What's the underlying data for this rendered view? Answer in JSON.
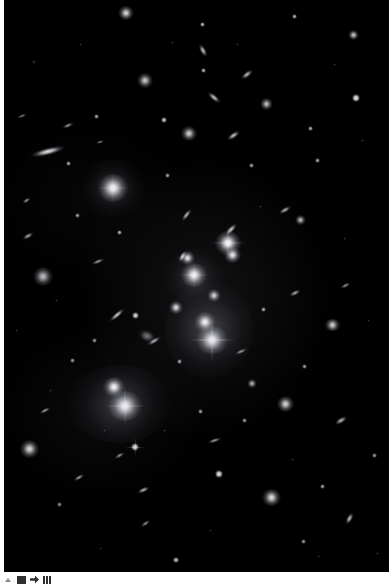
{
  "page": {
    "background_color": "#ffffff",
    "width": 392,
    "height": 587
  },
  "image_plate": {
    "name": "deep-field-astronomy-image",
    "alt_text": "Deep field astronomical image of a galaxy cluster",
    "background_color": "#000000",
    "left": 4,
    "top": 0,
    "width": 385,
    "height": 572,
    "objects": [
      {
        "kind": "gal",
        "x": 109,
        "y": 188,
        "w": 30,
        "h": 28,
        "b": 1.0
      },
      {
        "kind": "halo",
        "x": 109,
        "y": 188,
        "w": 62,
        "h": 58,
        "b": 0.55
      },
      {
        "kind": "gal",
        "x": 121,
        "y": 406,
        "w": 34,
        "h": 30,
        "b": 1.0
      },
      {
        "kind": "halo",
        "x": 116,
        "y": 404,
        "w": 104,
        "h": 78,
        "b": 0.7
      },
      {
        "kind": "gal",
        "x": 110,
        "y": 387,
        "w": 22,
        "h": 20,
        "b": 0.95
      },
      {
        "kind": "gal",
        "x": 208,
        "y": 340,
        "w": 32,
        "h": 28,
        "b": 1.0
      },
      {
        "kind": "halo",
        "x": 205,
        "y": 330,
        "w": 88,
        "h": 96,
        "b": 0.75
      },
      {
        "kind": "gal",
        "x": 201,
        "y": 322,
        "w": 22,
        "h": 20,
        "b": 0.92
      },
      {
        "kind": "gal",
        "x": 190,
        "y": 275,
        "w": 26,
        "h": 24,
        "b": 1.0
      },
      {
        "kind": "halo",
        "x": 190,
        "y": 277,
        "w": 58,
        "h": 54,
        "b": 0.5
      },
      {
        "kind": "gal",
        "x": 224,
        "y": 243,
        "w": 26,
        "h": 24,
        "b": 1.0
      },
      {
        "kind": "gal",
        "x": 228,
        "y": 255,
        "w": 17,
        "h": 16,
        "b": 0.9
      },
      {
        "kind": "gal",
        "x": 183,
        "y": 258,
        "w": 15,
        "h": 14,
        "b": 0.88
      },
      {
        "kind": "gal",
        "x": 172,
        "y": 307,
        "w": 14,
        "h": 13,
        "b": 0.85
      },
      {
        "kind": "gal",
        "x": 210,
        "y": 295,
        "w": 14,
        "h": 13,
        "b": 0.8
      },
      {
        "kind": "gal",
        "x": 39,
        "y": 276,
        "w": 20,
        "h": 19,
        "b": 0.72
      },
      {
        "kind": "gal",
        "x": 281,
        "y": 404,
        "w": 17,
        "h": 16,
        "b": 0.82
      },
      {
        "kind": "gal",
        "x": 267,
        "y": 497,
        "w": 19,
        "h": 17,
        "b": 0.86
      },
      {
        "kind": "gal",
        "x": 25,
        "y": 449,
        "w": 19,
        "h": 18,
        "b": 0.84
      },
      {
        "kind": "gal",
        "x": 185,
        "y": 133,
        "w": 16,
        "h": 15,
        "b": 0.8
      },
      {
        "kind": "gal",
        "x": 141,
        "y": 80,
        "w": 16,
        "h": 15,
        "b": 0.78
      },
      {
        "kind": "gal",
        "x": 122,
        "y": 13,
        "w": 16,
        "h": 14,
        "b": 0.84
      },
      {
        "kind": "gal",
        "x": 262,
        "y": 104,
        "w": 13,
        "h": 12,
        "b": 0.76
      },
      {
        "kind": "gal",
        "x": 349,
        "y": 35,
        "w": 11,
        "h": 10,
        "b": 0.78
      },
      {
        "kind": "gal",
        "x": 296,
        "y": 220,
        "w": 11,
        "h": 10,
        "b": 0.74
      },
      {
        "kind": "gal",
        "x": 328,
        "y": 325,
        "w": 17,
        "h": 12,
        "b": 0.8
      },
      {
        "kind": "gal",
        "x": 248,
        "y": 383,
        "w": 10,
        "h": 9,
        "b": 0.7
      },
      {
        "kind": "streak",
        "x": 44,
        "y": 151,
        "w": 40,
        "h": 9,
        "r": -14,
        "b": 0.92
      },
      {
        "kind": "streak",
        "x": 210,
        "y": 97,
        "w": 18,
        "h": 7,
        "r": 40,
        "b": 0.78
      },
      {
        "kind": "streak",
        "x": 199,
        "y": 50,
        "w": 16,
        "h": 7,
        "r": 62,
        "b": 0.76
      },
      {
        "kind": "streak",
        "x": 243,
        "y": 74,
        "w": 16,
        "h": 7,
        "r": -38,
        "b": 0.74
      },
      {
        "kind": "streak",
        "x": 227,
        "y": 229,
        "w": 18,
        "h": 7,
        "r": -46,
        "b": 0.8
      },
      {
        "kind": "streak",
        "x": 182,
        "y": 215,
        "w": 17,
        "h": 6,
        "r": -52,
        "b": 0.72
      },
      {
        "kind": "streak",
        "x": 178,
        "y": 256,
        "w": 15,
        "h": 7,
        "r": -58,
        "b": 0.8
      },
      {
        "kind": "streak",
        "x": 113,
        "y": 315,
        "w": 22,
        "h": 6,
        "r": -40,
        "b": 0.82
      },
      {
        "kind": "streak",
        "x": 150,
        "y": 341,
        "w": 18,
        "h": 6,
        "r": -30,
        "b": 0.72
      },
      {
        "kind": "streak",
        "x": 143,
        "y": 336,
        "w": 20,
        "h": 14,
        "r": 20,
        "b": 0.45
      },
      {
        "kind": "streak",
        "x": 94,
        "y": 261,
        "w": 16,
        "h": 5,
        "r": -22,
        "b": 0.62
      },
      {
        "kind": "streak",
        "x": 24,
        "y": 236,
        "w": 14,
        "h": 6,
        "r": -30,
        "b": 0.66
      },
      {
        "kind": "streak",
        "x": 22,
        "y": 200,
        "w": 11,
        "h": 5,
        "r": -34,
        "b": 0.58
      },
      {
        "kind": "streak",
        "x": 64,
        "y": 125,
        "w": 14,
        "h": 5,
        "r": -22,
        "b": 0.6
      },
      {
        "kind": "streak",
        "x": 41,
        "y": 410,
        "w": 14,
        "h": 5,
        "r": -28,
        "b": 0.62
      },
      {
        "kind": "streak",
        "x": 75,
        "y": 477,
        "w": 14,
        "h": 5,
        "r": -30,
        "b": 0.64
      },
      {
        "kind": "streak",
        "x": 139,
        "y": 490,
        "w": 15,
        "h": 6,
        "r": -24,
        "b": 0.7
      },
      {
        "kind": "streak",
        "x": 115,
        "y": 455,
        "w": 13,
        "h": 5,
        "r": -30,
        "b": 0.58
      },
      {
        "kind": "streak",
        "x": 210,
        "y": 440,
        "w": 17,
        "h": 5,
        "r": -18,
        "b": 0.6
      },
      {
        "kind": "streak",
        "x": 237,
        "y": 351,
        "w": 16,
        "h": 5,
        "r": -24,
        "b": 0.58
      },
      {
        "kind": "streak",
        "x": 291,
        "y": 293,
        "w": 14,
        "h": 6,
        "r": -26,
        "b": 0.66
      },
      {
        "kind": "streak",
        "x": 281,
        "y": 210,
        "w": 16,
        "h": 6,
        "r": -30,
        "b": 0.7
      },
      {
        "kind": "streak",
        "x": 229,
        "y": 135,
        "w": 17,
        "h": 7,
        "r": -34,
        "b": 0.78
      },
      {
        "kind": "streak",
        "x": 341,
        "y": 285,
        "w": 13,
        "h": 5,
        "r": -28,
        "b": 0.58
      },
      {
        "kind": "streak",
        "x": 337,
        "y": 420,
        "w": 16,
        "h": 7,
        "r": -32,
        "b": 0.72
      },
      {
        "kind": "streak",
        "x": 345,
        "y": 518,
        "w": 15,
        "h": 7,
        "r": -62,
        "b": 0.74
      },
      {
        "kind": "streak",
        "x": 141,
        "y": 523,
        "w": 13,
        "h": 5,
        "r": -34,
        "b": 0.56
      },
      {
        "kind": "streak",
        "x": 18,
        "y": 116,
        "w": 12,
        "h": 4,
        "r": -20,
        "b": 0.5
      },
      {
        "kind": "streak",
        "x": 96,
        "y": 142,
        "w": 10,
        "h": 4,
        "r": -16,
        "b": 0.48
      },
      {
        "kind": "star",
        "x": 352,
        "y": 98,
        "w": 8,
        "h": 8,
        "b": 0.95
      },
      {
        "kind": "star",
        "x": 215,
        "y": 474,
        "w": 8,
        "h": 8,
        "b": 0.92
      },
      {
        "kind": "star",
        "x": 131,
        "y": 447,
        "w": 8,
        "h": 8,
        "b": 0.9
      },
      {
        "kind": "star",
        "x": 131,
        "y": 315,
        "w": 7,
        "h": 7,
        "b": 0.86
      },
      {
        "kind": "star",
        "x": 160,
        "y": 120,
        "w": 6,
        "h": 6,
        "b": 0.8
      },
      {
        "kind": "star",
        "x": 198,
        "y": 24,
        "w": 5,
        "h": 5,
        "b": 0.72
      },
      {
        "kind": "star",
        "x": 199,
        "y": 70,
        "w": 5,
        "h": 5,
        "b": 0.7
      },
      {
        "kind": "star",
        "x": 290,
        "y": 16,
        "w": 5,
        "h": 5,
        "b": 0.7
      },
      {
        "kind": "star",
        "x": 306,
        "y": 128,
        "w": 5,
        "h": 5,
        "b": 0.68
      },
      {
        "kind": "star",
        "x": 313,
        "y": 160,
        "w": 5,
        "h": 5,
        "b": 0.66
      },
      {
        "kind": "star",
        "x": 64,
        "y": 163,
        "w": 5,
        "h": 5,
        "b": 0.66
      },
      {
        "kind": "star",
        "x": 92,
        "y": 116,
        "w": 5,
        "h": 5,
        "b": 0.64
      },
      {
        "kind": "star",
        "x": 115,
        "y": 232,
        "w": 5,
        "h": 5,
        "b": 0.68
      },
      {
        "kind": "star",
        "x": 73,
        "y": 215,
        "w": 5,
        "h": 5,
        "b": 0.62
      },
      {
        "kind": "star",
        "x": 163,
        "y": 175,
        "w": 5,
        "h": 5,
        "b": 0.62
      },
      {
        "kind": "star",
        "x": 247,
        "y": 165,
        "w": 5,
        "h": 5,
        "b": 0.64
      },
      {
        "kind": "star",
        "x": 259,
        "y": 309,
        "w": 5,
        "h": 5,
        "b": 0.66
      },
      {
        "kind": "star",
        "x": 175,
        "y": 361,
        "w": 5,
        "h": 5,
        "b": 0.66
      },
      {
        "kind": "star",
        "x": 68,
        "y": 360,
        "w": 5,
        "h": 5,
        "b": 0.6
      },
      {
        "kind": "star",
        "x": 90,
        "y": 340,
        "w": 5,
        "h": 5,
        "b": 0.58
      },
      {
        "kind": "star",
        "x": 196,
        "y": 411,
        "w": 5,
        "h": 5,
        "b": 0.62
      },
      {
        "kind": "star",
        "x": 240,
        "y": 420,
        "w": 5,
        "h": 5,
        "b": 0.6
      },
      {
        "kind": "star",
        "x": 300,
        "y": 366,
        "w": 5,
        "h": 5,
        "b": 0.6
      },
      {
        "kind": "star",
        "x": 318,
        "y": 486,
        "w": 5,
        "h": 5,
        "b": 0.62
      },
      {
        "kind": "star",
        "x": 370,
        "y": 455,
        "w": 5,
        "h": 5,
        "b": 0.6
      },
      {
        "kind": "star",
        "x": 172,
        "y": 560,
        "w": 6,
        "h": 6,
        "b": 0.78
      },
      {
        "kind": "star",
        "x": 299,
        "y": 541,
        "w": 5,
        "h": 5,
        "b": 0.58
      },
      {
        "kind": "star",
        "x": 55,
        "y": 504,
        "w": 5,
        "h": 5,
        "b": 0.56
      },
      {
        "kind": "speck",
        "x": 30,
        "y": 62,
        "w": 4,
        "h": 4,
        "b": 0.45
      },
      {
        "kind": "speck",
        "x": 76,
        "y": 44,
        "w": 3,
        "h": 3,
        "b": 0.4
      },
      {
        "kind": "speck",
        "x": 168,
        "y": 42,
        "w": 3,
        "h": 3,
        "b": 0.4
      },
      {
        "kind": "speck",
        "x": 233,
        "y": 44,
        "w": 3,
        "h": 3,
        "b": 0.4
      },
      {
        "kind": "speck",
        "x": 330,
        "y": 64,
        "w": 3,
        "h": 3,
        "b": 0.4
      },
      {
        "kind": "speck",
        "x": 358,
        "y": 140,
        "w": 3,
        "h": 3,
        "b": 0.42
      },
      {
        "kind": "speck",
        "x": 52,
        "y": 300,
        "w": 3,
        "h": 3,
        "b": 0.42
      },
      {
        "kind": "speck",
        "x": 12,
        "y": 330,
        "w": 3,
        "h": 3,
        "b": 0.38
      },
      {
        "kind": "speck",
        "x": 100,
        "y": 430,
        "w": 3,
        "h": 3,
        "b": 0.4
      },
      {
        "kind": "speck",
        "x": 160,
        "y": 430,
        "w": 3,
        "h": 3,
        "b": 0.38
      },
      {
        "kind": "speck",
        "x": 222,
        "y": 250,
        "w": 3,
        "h": 3,
        "b": 0.4
      },
      {
        "kind": "speck",
        "x": 256,
        "y": 206,
        "w": 3,
        "h": 3,
        "b": 0.38
      },
      {
        "kind": "speck",
        "x": 340,
        "y": 238,
        "w": 3,
        "h": 3,
        "b": 0.4
      },
      {
        "kind": "speck",
        "x": 364,
        "y": 320,
        "w": 3,
        "h": 3,
        "b": 0.38
      },
      {
        "kind": "speck",
        "x": 288,
        "y": 459,
        "w": 3,
        "h": 3,
        "b": 0.38
      },
      {
        "kind": "speck",
        "x": 206,
        "y": 530,
        "w": 3,
        "h": 3,
        "b": 0.38
      },
      {
        "kind": "speck",
        "x": 96,
        "y": 548,
        "w": 3,
        "h": 3,
        "b": 0.36
      },
      {
        "kind": "speck",
        "x": 46,
        "y": 390,
        "w": 3,
        "h": 3,
        "b": 0.36
      },
      {
        "kind": "speck",
        "x": 314,
        "y": 556,
        "w": 3,
        "h": 3,
        "b": 0.36
      },
      {
        "kind": "speck",
        "x": 373,
        "y": 553,
        "w": 3,
        "h": 3,
        "b": 0.36
      }
    ]
  },
  "bottom_bar": {
    "name": "bottom-toolbar",
    "items": [
      {
        "name": "expand-caret-icon",
        "label": ""
      },
      {
        "name": "document-icon",
        "label": ""
      },
      {
        "name": "share-icon",
        "label": ""
      },
      {
        "name": "grid-icon",
        "label": ""
      }
    ]
  }
}
